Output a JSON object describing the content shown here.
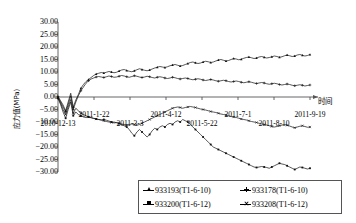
{
  "chart_data": {
    "type": "line",
    "title": "",
    "xlabel": "时间",
    "ylabel": "应力值(MPa)",
    "ylim": [
      -30,
      30
    ],
    "ytick_step": 5,
    "yticks": [
      "30.00",
      "25.00",
      "20.00",
      "15.00",
      "10.00",
      "5.00",
      "0.00",
      "-5.00",
      "-10.00",
      "-15.00",
      "-20.00",
      "-25.00",
      "-30.00"
    ],
    "ytick_values": [
      30,
      25,
      20,
      15,
      10,
      5,
      0,
      -5,
      -10,
      -15,
      -20,
      -25,
      -30
    ],
    "xticks": [
      "2010-12-13",
      "2011-1-22",
      "2011-3-3",
      "2011-4-12",
      "2011-5-22",
      "2011-7-1",
      "2011-8-10",
      "2011-9-19"
    ],
    "xtick_positions": [
      0,
      1,
      2,
      3,
      4,
      5,
      6,
      7
    ],
    "grid": false,
    "legend_position": "bottom",
    "series": [
      {
        "name": "933193(T1-6-10)",
        "marker": "triangle",
        "values": [
          0.2,
          -1.5,
          -3.2,
          -5.5,
          -2.0,
          1.5,
          -4.0,
          -1.2,
          1.0,
          3.5,
          5.0,
          6.2,
          7.0,
          7.8,
          8.6,
          9.2,
          9.5,
          9.8,
          9.6,
          9.9,
          10.2,
          10.0,
          9.7,
          9.9,
          10.4,
          10.8,
          11.0,
          10.6,
          10.3,
          10.1,
          10.5,
          10.9,
          11.3,
          11.0,
          10.7,
          10.5,
          10.8,
          11.2,
          11.6,
          11.9,
          12.2,
          12.0,
          11.8,
          12.1,
          12.5,
          12.8,
          13.0,
          12.7,
          12.4,
          12.6,
          13.0,
          13.4,
          13.8,
          14.0,
          13.7,
          13.4,
          13.6,
          14.0,
          14.3,
          14.1,
          13.8,
          14.0,
          14.4,
          14.8,
          15.0,
          14.7,
          14.4,
          14.6,
          15.0,
          15.4,
          15.2,
          14.9,
          15.1,
          15.5,
          15.8,
          16.0,
          15.7,
          15.4,
          15.6,
          16.0,
          16.2,
          15.9,
          15.6,
          15.8,
          16.1,
          16.4,
          16.2,
          15.9,
          16.1,
          16.5,
          16.8,
          16.5,
          16.2,
          16.4,
          16.8,
          17.0,
          16.7,
          16.4,
          16.6,
          17.0
        ]
      },
      {
        "name": "933178(T1-6-10)",
        "marker": "plus",
        "values": [
          0.0,
          -2.0,
          -4.0,
          -6.0,
          -3.0,
          0.5,
          -5.0,
          -2.0,
          0.5,
          2.5,
          4.0,
          5.5,
          6.5,
          7.2,
          7.6,
          8.0,
          8.2,
          8.0,
          7.8,
          8.1,
          8.4,
          8.2,
          7.9,
          8.0,
          8.3,
          8.6,
          8.4,
          8.1,
          7.9,
          8.2,
          8.5,
          8.3,
          8.0,
          7.8,
          8.0,
          8.3,
          8.1,
          7.8,
          7.6,
          7.9,
          8.1,
          7.9,
          7.6,
          7.4,
          7.6,
          7.9,
          7.7,
          7.4,
          7.2,
          7.4,
          7.6,
          7.4,
          7.1,
          6.9,
          7.1,
          7.3,
          7.1,
          6.8,
          6.6,
          6.8,
          7.0,
          6.8,
          6.5,
          6.3,
          6.5,
          6.7,
          6.5,
          6.2,
          6.0,
          6.2,
          6.4,
          6.2,
          5.9,
          5.7,
          5.9,
          6.1,
          5.9,
          5.6,
          5.4,
          5.6,
          5.8,
          5.6,
          5.3,
          5.1,
          5.3,
          5.5,
          5.3,
          5.0,
          4.8,
          5.0,
          5.2,
          5.0,
          4.7,
          4.5,
          4.7,
          4.9,
          4.7,
          4.4,
          4.6,
          4.8
        ]
      },
      {
        "name": "933200(T1-6-12)",
        "marker": "square",
        "values": [
          -0.5,
          -3.0,
          -6.0,
          -8.5,
          -5.0,
          -2.0,
          -7.5,
          -6.0,
          -7.0,
          -7.5,
          -8.0,
          -8.2,
          -8.0,
          -8.3,
          -8.6,
          -8.8,
          -9.0,
          -9.2,
          -9.0,
          -9.3,
          -9.6,
          -10.0,
          -10.4,
          -10.2,
          -10.6,
          -11.0,
          -11.5,
          -12.0,
          -13.0,
          -14.5,
          -15.5,
          -14.0,
          -13.0,
          -14.0,
          -15.0,
          -16.0,
          -15.0,
          -13.5,
          -12.5,
          -13.0,
          -12.0,
          -11.5,
          -12.0,
          -11.0,
          -10.5,
          -11.0,
          -10.0,
          -9.5,
          -10.0,
          -9.0,
          -9.5,
          -10.0,
          -11.0,
          -12.0,
          -13.0,
          -14.0,
          -15.0,
          -16.0,
          -17.0,
          -18.0,
          -19.0,
          -20.0,
          -20.5,
          -21.0,
          -21.5,
          -22.0,
          -22.5,
          -23.0,
          -23.5,
          -24.0,
          -24.5,
          -25.0,
          -25.5,
          -26.0,
          -26.5,
          -27.0,
          -27.5,
          -28.0,
          -28.2,
          -28.0,
          -27.8,
          -28.0,
          -28.2,
          -28.5,
          -28.0,
          -27.5,
          -27.0,
          -26.5,
          -26.8,
          -27.0,
          -27.5,
          -28.0,
          -28.5,
          -29.0,
          -28.5,
          -28.0,
          -28.2,
          -28.5,
          -28.8,
          -28.5
        ]
      },
      {
        "name": "933208(T1-6-12)",
        "marker": "x",
        "values": [
          -0.3,
          -2.5,
          -5.0,
          -7.0,
          -4.0,
          -1.0,
          -6.5,
          -4.5,
          -5.5,
          -6.5,
          -7.0,
          -7.5,
          -8.0,
          -8.2,
          -8.5,
          -8.8,
          -9.0,
          -9.2,
          -9.5,
          -9.8,
          -10.0,
          -10.2,
          -10.0,
          -10.3,
          -10.6,
          -10.8,
          -11.0,
          -11.2,
          -11.0,
          -10.8,
          -11.0,
          -11.3,
          -11.0,
          -10.5,
          -10.0,
          -9.5,
          -9.0,
          -8.5,
          -8.0,
          -7.5,
          -7.0,
          -6.5,
          -6.0,
          -5.5,
          -5.0,
          -4.5,
          -4.2,
          -4.0,
          -4.2,
          -4.5,
          -4.2,
          -4.0,
          -3.8,
          -4.0,
          -4.2,
          -4.5,
          -4.8,
          -5.0,
          -5.2,
          -5.5,
          -5.8,
          -6.0,
          -6.2,
          -6.5,
          -6.8,
          -7.0,
          -7.2,
          -7.5,
          -7.8,
          -8.0,
          -8.2,
          -8.5,
          -8.8,
          -9.0,
          -9.2,
          -9.5,
          -9.8,
          -10.0,
          -10.2,
          -10.5,
          -10.8,
          -11.0,
          -11.2,
          -11.5,
          -11.8,
          -12.0,
          -11.8,
          -11.5,
          -11.2,
          -11.0,
          -11.3,
          -11.6,
          -12.0,
          -12.3,
          -12.0,
          -11.7,
          -11.5,
          -11.8,
          -12.1,
          -12.0
        ]
      }
    ]
  },
  "legend": {
    "items": [
      {
        "label": "933193(T1-6-10)",
        "marker": "triangle"
      },
      {
        "label": "933178(T1-6-10)",
        "marker": "plus"
      },
      {
        "label": "933200(T1-6-12)",
        "marker": "square"
      },
      {
        "label": "933208(T1-6-12)",
        "marker": "x"
      }
    ]
  }
}
